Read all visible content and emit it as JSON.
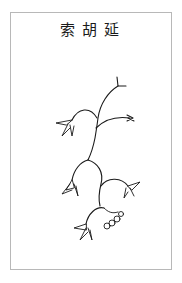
{
  "illustration": {
    "title": "索胡延",
    "subject": "plant-drawing",
    "colors": {
      "ink": "#1a1a1a",
      "border": "#b8b8b8",
      "background": "#ffffff"
    }
  }
}
